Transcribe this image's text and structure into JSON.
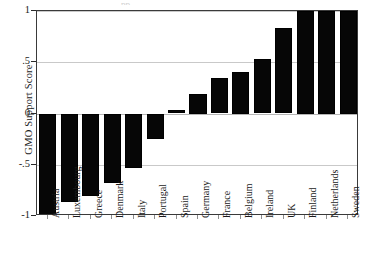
{
  "chart_data": {
    "type": "bar",
    "title": "",
    "xlabel": "",
    "ylabel": "GMO Support Score",
    "ylim": [
      -1,
      1
    ],
    "grid": true,
    "legend": "none",
    "orientation": "vertical",
    "bar_color": "#060606",
    "categories": [
      "Austria",
      "Luxembourg",
      "Greece",
      "Denmark",
      "Italy",
      "Portugal",
      "Spain",
      "Germany",
      "France",
      "Belgium",
      "Ireland",
      "UK",
      "Finland",
      "Netherlands",
      "Sweden"
    ],
    "values": [
      -1.0,
      -0.86,
      -0.8,
      -0.68,
      -0.53,
      -0.25,
      0.03,
      0.19,
      0.35,
      0.41,
      0.53,
      0.83,
      1.0,
      1.0,
      1.0
    ],
    "y_ticks": [
      1,
      0.5,
      0,
      -0.5,
      -1
    ],
    "y_tick_labels": [
      "1",
      ".5",
      "0",
      "-.5",
      "-1"
    ]
  },
  "axes": {
    "y_title": "GMO Support Score"
  },
  "artifact": {
    "top_text": "pp"
  }
}
